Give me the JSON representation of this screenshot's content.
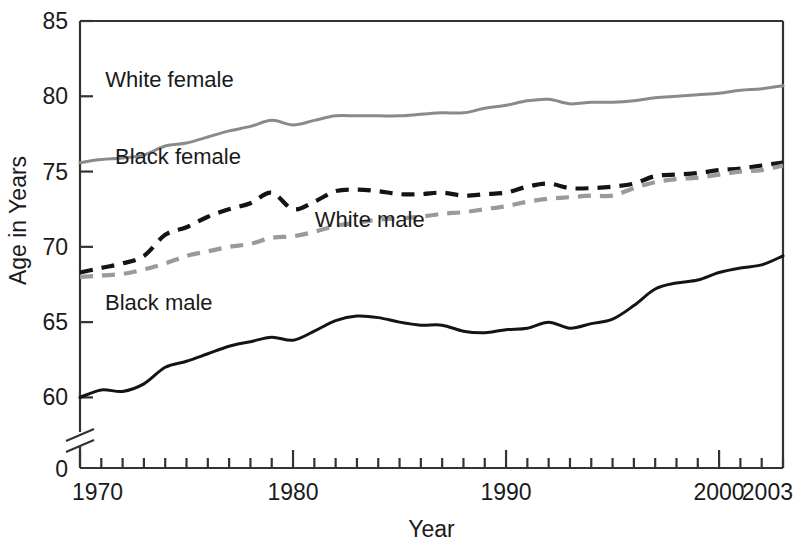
{
  "chart_data": {
    "type": "line",
    "title": "",
    "xlabel": "Year",
    "ylabel": "Age in Years",
    "xlim": [
      1970,
      2003
    ],
    "ylim": [
      58.5,
      85
    ],
    "grid": false,
    "legend_position": "inline-labels",
    "y_ticks": [
      "85",
      "80",
      "75",
      "70",
      "65",
      "60",
      "0"
    ],
    "y_tick_values": [
      85,
      80,
      75,
      70,
      65,
      60
    ],
    "x_ticks": [
      "1970",
      "1980",
      "1990",
      "2000",
      "2003"
    ],
    "x_tick_values": [
      1970,
      1980,
      1990,
      2000,
      2003
    ],
    "x_minor_step": 1,
    "axis_break": true,
    "axis_break_note": "y-axis broken between 0 and ~59",
    "x": [
      1970,
      1971,
      1972,
      1973,
      1974,
      1975,
      1976,
      1977,
      1978,
      1979,
      1980,
      1981,
      1982,
      1983,
      1984,
      1985,
      1986,
      1987,
      1988,
      1989,
      1990,
      1991,
      1992,
      1993,
      1994,
      1995,
      1996,
      1997,
      1998,
      1999,
      2000,
      2001,
      2002,
      2003
    ],
    "series": [
      {
        "name": "White female",
        "style": "solid",
        "color": "#8a8a8a",
        "label_x": 1974.2,
        "label_y": 80.6,
        "values": [
          75.6,
          75.8,
          75.9,
          76.1,
          76.7,
          76.9,
          77.3,
          77.7,
          78.0,
          78.4,
          78.1,
          78.4,
          78.7,
          78.7,
          78.7,
          78.7,
          78.8,
          78.9,
          78.9,
          79.2,
          79.4,
          79.7,
          79.8,
          79.5,
          79.6,
          79.6,
          79.7,
          79.9,
          80.0,
          80.1,
          80.2,
          80.4,
          80.5,
          80.7
        ]
      },
      {
        "name": "Black female",
        "style": "dashed",
        "color": "#141414",
        "label_x": 1974.6,
        "label_y": 75.5,
        "values": [
          68.3,
          68.6,
          68.9,
          69.4,
          70.8,
          71.3,
          72.0,
          72.5,
          72.9,
          73.6,
          72.5,
          73.0,
          73.7,
          73.8,
          73.7,
          73.5,
          73.5,
          73.6,
          73.4,
          73.5,
          73.6,
          74.0,
          74.2,
          73.9,
          73.9,
          74.0,
          74.2,
          74.7,
          74.8,
          74.9,
          75.1,
          75.2,
          75.4,
          75.6
        ]
      },
      {
        "name": "White male",
        "style": "dashed",
        "color": "#9a9a9a",
        "label_x": 1983.6,
        "label_y": 71.3,
        "values": [
          68.0,
          68.1,
          68.2,
          68.5,
          68.9,
          69.4,
          69.7,
          70.0,
          70.2,
          70.6,
          70.7,
          71.0,
          71.4,
          71.6,
          71.8,
          71.9,
          72.0,
          72.2,
          72.3,
          72.5,
          72.7,
          73.0,
          73.2,
          73.3,
          73.4,
          73.4,
          73.9,
          74.3,
          74.5,
          74.6,
          74.8,
          75.0,
          75.1,
          75.4
        ]
      },
      {
        "name": "Black male",
        "style": "solid",
        "color": "#141414",
        "label_x": 1973.7,
        "label_y": 65.8,
        "values": [
          60.0,
          60.5,
          60.4,
          60.9,
          62.0,
          62.4,
          62.9,
          63.4,
          63.7,
          64.0,
          63.8,
          64.4,
          65.1,
          65.4,
          65.3,
          65.0,
          64.8,
          64.8,
          64.4,
          64.3,
          64.5,
          64.6,
          65.0,
          64.6,
          64.9,
          65.2,
          66.1,
          67.2,
          67.6,
          67.8,
          68.3,
          68.6,
          68.8,
          69.4
        ]
      }
    ]
  },
  "axis": {
    "y_label": "Age in Years",
    "x_label": "Year",
    "zero_label": "0"
  },
  "caption": {
    "partial_text": ""
  }
}
